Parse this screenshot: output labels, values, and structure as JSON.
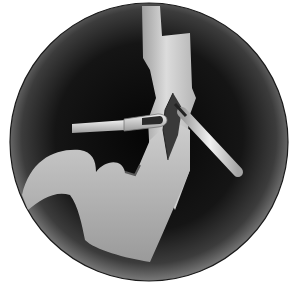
{
  "figure": {
    "colors": {
      "background": "#ffffff",
      "vignette_dark": "#0a0a0a",
      "vignette_edge": "#6a6a6a",
      "tissue_light": "#d8d8d8",
      "tissue_mid": "#a8a8a8",
      "incision": "#3a3a3a",
      "instrument": "#e6e6e6"
    }
  }
}
